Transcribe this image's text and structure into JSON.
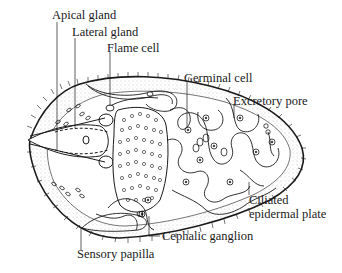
{
  "diagram": {
    "labels": {
      "apical_gland": "Apical gland",
      "lateral_gland": "Lateral gland",
      "flame_cell": "Flame cell",
      "germinal_cell": "Germinal cell",
      "excretory_pore": "Excretory pore",
      "ciliated_epidermal_plate_line1": "Ciliated",
      "ciliated_epidermal_plate_line2": "epidermal plate",
      "cephalic_ganglion": "Cephalic ganglion",
      "sensory_papilla": "Sensory papilla"
    },
    "colors": {
      "ink": "#1a1a1a",
      "background": "#ffffff",
      "stipple": "#9a9a9a"
    }
  }
}
